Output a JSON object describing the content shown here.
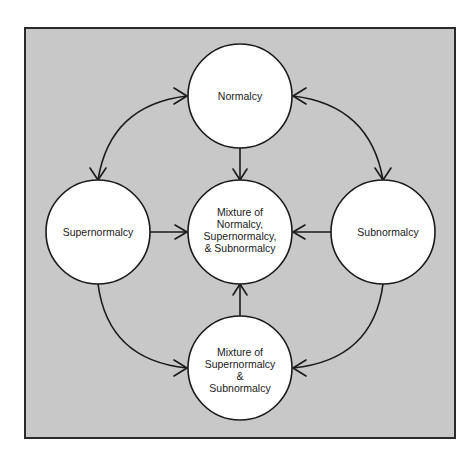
{
  "diagram": {
    "type": "state-transition",
    "background_color": "#c8c8c8",
    "nodes": {
      "normalcy": {
        "lines": [
          "Normalcy"
        ]
      },
      "supernormalcy": {
        "lines": [
          "Supernormalcy"
        ]
      },
      "subnormalcy": {
        "lines": [
          "Subnormalcy"
        ]
      },
      "mixture_all": {
        "lines": [
          "Mixture of",
          "Normalcy,",
          "Supernormalcy,",
          "& Subnormalcy"
        ]
      },
      "mixture_super_sub": {
        "lines": [
          "Mixture of",
          "Supernormalcy",
          "&",
          "Subnormalcy"
        ]
      }
    },
    "edges": [
      {
        "from": "normalcy",
        "to": "supernormalcy",
        "bidirectional": true
      },
      {
        "from": "normalcy",
        "to": "subnormalcy",
        "bidirectional": true
      },
      {
        "from": "normalcy",
        "to": "mixture_all",
        "bidirectional": false
      },
      {
        "from": "supernormalcy",
        "to": "mixture_all",
        "bidirectional": false
      },
      {
        "from": "subnormalcy",
        "to": "mixture_all",
        "bidirectional": false
      },
      {
        "from": "mixture_super_sub",
        "to": "mixture_all",
        "bidirectional": false
      },
      {
        "from": "supernormalcy",
        "to": "mixture_super_sub",
        "bidirectional": false
      },
      {
        "from": "subnormalcy",
        "to": "mixture_super_sub",
        "bidirectional": false
      }
    ]
  }
}
